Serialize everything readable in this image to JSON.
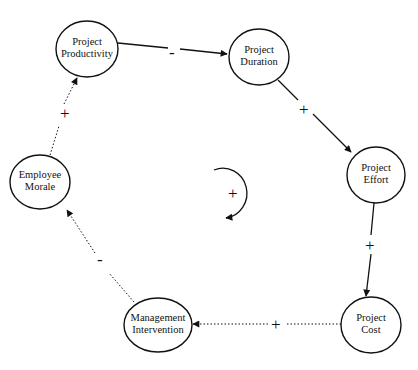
{
  "diagram": {
    "type": "causal-loop",
    "loop_polarity": "+",
    "nodes": [
      {
        "id": "productivity",
        "line1": "Project",
        "line2": "Productivity",
        "cx": 87,
        "cy": 49,
        "rx": 31,
        "ry": 28
      },
      {
        "id": "duration",
        "line1": "Project",
        "line2": "Duration",
        "cx": 259,
        "cy": 57,
        "rx": 30,
        "ry": 28
      },
      {
        "id": "effort",
        "line1": "Project",
        "line2": "Effort",
        "cx": 376,
        "cy": 175,
        "rx": 29,
        "ry": 28
      },
      {
        "id": "cost",
        "line1": "Project",
        "line2": "Cost",
        "cx": 371,
        "cy": 325,
        "rx": 30,
        "ry": 28
      },
      {
        "id": "intervention",
        "line1": "Management",
        "line2": "Intervention",
        "cx": 158,
        "cy": 325,
        "rx": 34,
        "ry": 27
      },
      {
        "id": "morale",
        "line1": "Employee",
        "line2": "Morale",
        "cx": 40,
        "cy": 182,
        "rx": 30,
        "ry": 27
      }
    ],
    "edges": [
      {
        "from": "Project Productivity",
        "to": "Project Duration",
        "polarity": "-",
        "style": "solid"
      },
      {
        "from": "Project Duration",
        "to": "Project Effort",
        "polarity": "+",
        "style": "solid"
      },
      {
        "from": "Project Effort",
        "to": "Project Cost",
        "polarity": "+",
        "style": "solid"
      },
      {
        "from": "Project Cost",
        "to": "Management Intervention",
        "polarity": "+",
        "style": "dotted"
      },
      {
        "from": "Management Intervention",
        "to": "Employee Morale",
        "polarity": "-",
        "style": "dotted"
      },
      {
        "from": "Employee Morale",
        "to": "Project Productivity",
        "polarity": "+",
        "style": "dotted"
      }
    ]
  }
}
